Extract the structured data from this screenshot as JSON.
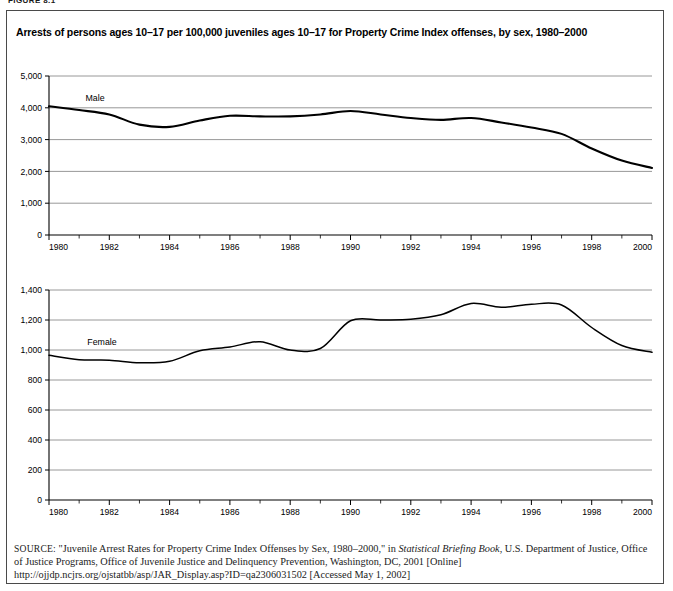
{
  "figure_label": "FIGURE 8.1",
  "title": "Arrests of persons ages 10–17 per 100,000 juveniles ages 10–17 for Property Crime Index offenses, by sex, 1980–2000",
  "source": {
    "label": "SOURCE:",
    "text_part1": " \"Juvenile Arrest Rates for Property Crime Index Offenses by Sex, 1980–2000,\" in ",
    "italic_title": "Statistical Briefing Book",
    "text_part2": ",  U.S. Department of Justice, Office of Justice Programs, Office of Juvenile Justice and Delinquency Prevention, Washington, DC, 2001 [Online] http://ojjdp.ncjrs.org/ojstatbb/asp/JAR_Display.asp?ID=qa2306031502 [Accessed May 1, 2002]"
  },
  "chart_data": [
    {
      "type": "line",
      "id": "male-chart",
      "title": "",
      "series_label": "Male",
      "xlabel": "",
      "ylabel": "",
      "xlim": [
        1980,
        2000
      ],
      "ylim": [
        0,
        5000
      ],
      "ytick_labels": [
        "5,000",
        "4,000",
        "3,000",
        "2,000",
        "1,000",
        "0"
      ],
      "ytick_values": [
        5000,
        4000,
        3000,
        2000,
        1000,
        0
      ],
      "xtick_labels": [
        "1980",
        "1982",
        "1984",
        "1986",
        "1988",
        "1990",
        "1992",
        "1994",
        "1996",
        "1998",
        "2000"
      ],
      "xtick_values": [
        1980,
        1982,
        1984,
        1986,
        1988,
        1990,
        1992,
        1994,
        1996,
        1998,
        2000
      ],
      "grid": true,
      "legend": "inline-label",
      "x": [
        1980,
        1981,
        1982,
        1983,
        1984,
        1985,
        1986,
        1987,
        1988,
        1989,
        1990,
        1991,
        1992,
        1993,
        1994,
        1995,
        1996,
        1997,
        1998,
        1999,
        2000
      ],
      "values": [
        4050,
        3930,
        3790,
        3470,
        3400,
        3600,
        3750,
        3730,
        3730,
        3790,
        3900,
        3790,
        3680,
        3620,
        3680,
        3540,
        3380,
        3180,
        2720,
        2340,
        2110
      ]
    },
    {
      "type": "line",
      "id": "female-chart",
      "title": "",
      "series_label": "Female",
      "xlabel": "",
      "ylabel": "",
      "xlim": [
        1980,
        2000
      ],
      "ylim": [
        0,
        1400
      ],
      "ytick_labels": [
        "1,400",
        "1,200",
        "1,000",
        "800",
        "600",
        "400",
        "200",
        "0"
      ],
      "ytick_values": [
        1400,
        1200,
        1000,
        800,
        600,
        400,
        200,
        0
      ],
      "xtick_labels": [
        "1980",
        "1982",
        "1984",
        "1986",
        "1988",
        "1990",
        "1992",
        "1994",
        "1996",
        "1998",
        "2000"
      ],
      "xtick_values": [
        1980,
        1982,
        1984,
        1986,
        1988,
        1990,
        1992,
        1994,
        1996,
        1998,
        2000
      ],
      "grid": true,
      "legend": "inline-label",
      "x": [
        1980,
        1981,
        1982,
        1983,
        1984,
        1985,
        1986,
        1987,
        1988,
        1989,
        1990,
        1991,
        1992,
        1993,
        1994,
        1995,
        1996,
        1997,
        1998,
        1999,
        2000
      ],
      "values": [
        965,
        935,
        932,
        915,
        925,
        995,
        1020,
        1055,
        1000,
        1010,
        1195,
        1200,
        1205,
        1235,
        1310,
        1285,
        1305,
        1300,
        1150,
        1030,
        985
      ]
    }
  ],
  "colors": {
    "line": "#000000",
    "grid": "#8c8c8c",
    "axis": "#000000",
    "frame": "#4a4a4a",
    "text": "#000000"
  }
}
